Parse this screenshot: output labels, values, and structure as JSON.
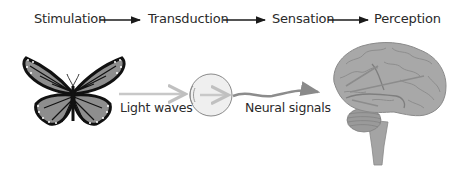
{
  "process": {
    "steps": [
      {
        "label": "Stimulation"
      },
      {
        "label": "Transduction"
      },
      {
        "label": "Sensation"
      },
      {
        "label": "Perception"
      }
    ]
  },
  "illustration": {
    "stimulus": "butterfly-icon",
    "receptor": "eye-icon",
    "processor": "brain-icon",
    "labels": {
      "light": "Light waves",
      "neural": "Neural signals"
    }
  },
  "colors": {
    "text": "#2a2a2a",
    "arrow": "#1a1a1a",
    "light_arrow": "#c8c8c8",
    "neural_arrow": "#8c8c8c",
    "brain_fill": "#a8a8a8",
    "eye_fill": "#efefef"
  }
}
